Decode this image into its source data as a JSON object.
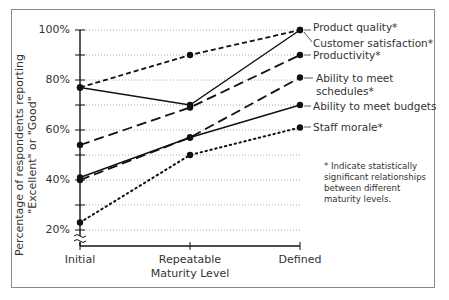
{
  "chart_data": {
    "type": "line",
    "title": "",
    "xlabel": "Maturity Level",
    "ylabel": "Percentage of respondents reporting \"Excellent\" or \"Good\"",
    "ylabel_lines": [
      "Percentage of respondents reporting",
      "\"Excellent\" or \"Good\""
    ],
    "categories": [
      "Initial",
      "Repeatable",
      "Defined"
    ],
    "yticks": [
      "20%",
      "40%",
      "60%",
      "80%",
      "100%"
    ],
    "ylim": [
      15,
      100
    ],
    "grid": "horizontal dotted at 10% intervals",
    "axis_break": true,
    "series": [
      {
        "name": "Product quality*",
        "values": [
          77,
          70,
          100
        ],
        "style": "solid"
      },
      {
        "name": "Customer satisfaction*",
        "values": [
          77,
          90,
          100
        ],
        "style": "short-dash"
      },
      {
        "name": "Productivity*",
        "values": [
          54,
          69,
          90
        ],
        "style": "long-dash"
      },
      {
        "name": "Ability to meet schedules*",
        "values": [
          40,
          57,
          81
        ],
        "style": "long-dash"
      },
      {
        "name": "Ability to meet budgets",
        "values": [
          41,
          57,
          70
        ],
        "style": "solid"
      },
      {
        "name": "Staff morale*",
        "values": [
          23,
          50,
          61
        ],
        "style": "dotted"
      }
    ],
    "legend_position": "right, inline labels at line ends",
    "annotation": "* Indicate statistically significant relationships between different maturity levels."
  },
  "labels": {
    "legend": {
      "product_quality": "Product quality*",
      "customer_satisfaction": "Customer satisfaction*",
      "productivity": "Productivity*",
      "schedules_line1": "Ability to meet",
      "schedules_line2": "schedules*",
      "budgets": "Ability to meet budgets",
      "staff_morale": "Staff morale*"
    },
    "note": "* Indicate statistically significant relationships between different maturity levels."
  }
}
